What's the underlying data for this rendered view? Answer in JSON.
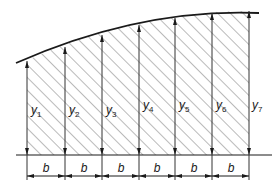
{
  "figure": {
    "type": "trapezoidal-rule-area-diagram",
    "ordinates": [
      {
        "label": "y",
        "sub": "1"
      },
      {
        "label": "y",
        "sub": "2"
      },
      {
        "label": "y",
        "sub": "3"
      },
      {
        "label": "y",
        "sub": "4"
      },
      {
        "label": "y",
        "sub": "5"
      },
      {
        "label": "y",
        "sub": "6"
      },
      {
        "label": "y",
        "sub": "7"
      }
    ],
    "intervals": [
      "b",
      "b",
      "b",
      "b",
      "b",
      "b"
    ],
    "colors": {
      "line": "#1a1a1a",
      "hatch": "#555555",
      "background": "#ffffff"
    }
  }
}
